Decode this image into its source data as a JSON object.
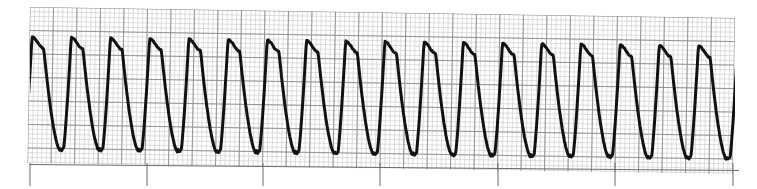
{
  "document": {
    "title": "ECG Rhythm Strip",
    "description": "Single-lead electrocardiogram rhythm strip on pink-gray ECG graph paper showing a rapid, regular, wide sine-wave rhythm"
  },
  "paper": {
    "background_color": "#ffffff",
    "minor_grid_color": "#c9c4c9",
    "major_grid_color": "#8f8a90",
    "minor_grid_px": 4.7,
    "major_grid_px": 23.5,
    "small_squares_per_large": 5,
    "grid_left_px": 30,
    "grid_top_px": 7,
    "grid_right_px": 735,
    "grid_bottom_px": 163,
    "skew_degrees": 0.9
  },
  "trace": {
    "color": "#111111",
    "stroke_width_px": 3.0,
    "baseline_tick_color": "#6a6a70",
    "baseline_tick_width_px": 1.0,
    "baseline_tick_bottom_px": 186
  },
  "chart_data": {
    "type": "line",
    "xlabel": "Time",
    "ylabel": "Amplitude",
    "grid": true,
    "legend": null,
    "xlim": [
      30,
      735
    ],
    "ylim": [
      163,
      7
    ],
    "waveform": {
      "morphology": "sine-wave",
      "peak_y_px": 37,
      "trough_y_px": 150,
      "period_px": 39.2,
      "first_peak_x_px": 32,
      "cycle_count": 18,
      "peak_shape": "broad-rounded",
      "trough_shape": "narrow-sharp-v",
      "amplitude_px": 113
    },
    "baseline_ticks_x_px": [
      30,
      147,
      263,
      380,
      498,
      615,
      733
    ],
    "tick_interval_px": 117.2
  }
}
